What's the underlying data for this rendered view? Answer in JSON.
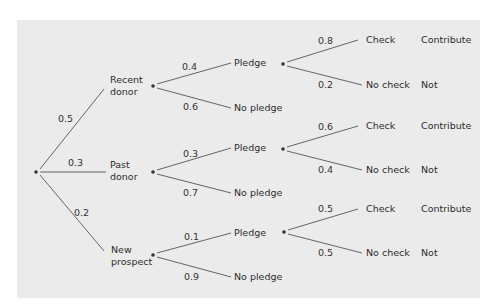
{
  "diagram": {
    "type": "probability-tree",
    "background": "#ebebeb",
    "line_color": "#555555",
    "text_color": "#2b2b2b",
    "root": {
      "x": 36,
      "y": 172
    },
    "level1": [
      {
        "label_lines": [
          "Recent",
          "donor"
        ],
        "prob": "0.5",
        "node": {
          "x": 153,
          "y": 86
        },
        "label_pos": {
          "x": 110,
          "y": 83
        },
        "edge_end": {
          "x": 104,
          "y": 89
        },
        "prob_pos": {
          "x": 58,
          "y": 122
        }
      },
      {
        "label_lines": [
          "Past",
          "donor"
        ],
        "prob": "0.3",
        "node": {
          "x": 153,
          "y": 172
        },
        "label_pos": {
          "x": 110,
          "y": 168
        },
        "edge_end": {
          "x": 106,
          "y": 172
        },
        "prob_pos": {
          "x": 68,
          "y": 166
        }
      },
      {
        "label_lines": [
          "New",
          "prospect"
        ],
        "prob": "0.2",
        "node": {
          "x": 153,
          "y": 255
        },
        "label_pos": {
          "x": 111,
          "y": 253
        },
        "edge_end": {
          "x": 104,
          "y": 251
        },
        "prob_pos": {
          "x": 74,
          "y": 216
        }
      }
    ],
    "level2": [
      {
        "parent": 0,
        "pledge": {
          "label": "Pledge",
          "prob": "0.4",
          "end": {
            "x": 231,
            "y": 63
          },
          "label_pos": {
            "x": 234,
            "y": 66
          },
          "prob_pos": {
            "x": 182,
            "y": 70
          }
        },
        "no_pledge": {
          "label": "No pledge",
          "prob": "0.6",
          "end": {
            "x": 231,
            "y": 108
          },
          "label_pos": {
            "x": 234,
            "y": 111
          },
          "prob_pos": {
            "x": 183,
            "y": 110
          }
        },
        "pledge_node": {
          "x": 283,
          "y": 64
        },
        "check": {
          "label": "Check",
          "prob": "0.8",
          "end": {
            "x": 358,
            "y": 40
          },
          "label_pos": {
            "x": 366,
            "y": 43
          },
          "prob_pos": {
            "x": 318,
            "y": 44
          },
          "outcome": "Contribute",
          "outcome_pos": {
            "x": 421,
            "y": 43
          }
        },
        "no_check": {
          "label": "No check",
          "prob": "0.2",
          "end": {
            "x": 362,
            "y": 85
          },
          "label_pos": {
            "x": 366,
            "y": 88
          },
          "prob_pos": {
            "x": 318,
            "y": 88
          },
          "outcome": "Not",
          "outcome_pos": {
            "x": 421,
            "y": 88
          }
        }
      },
      {
        "parent": 1,
        "pledge": {
          "label": "Pledge",
          "prob": "0.3",
          "end": {
            "x": 231,
            "y": 148
          },
          "label_pos": {
            "x": 234,
            "y": 151
          },
          "prob_pos": {
            "x": 183,
            "y": 157
          }
        },
        "no_pledge": {
          "label": "No pledge",
          "prob": "0.7",
          "end": {
            "x": 231,
            "y": 193
          },
          "label_pos": {
            "x": 234,
            "y": 196
          },
          "prob_pos": {
            "x": 183,
            "y": 196
          }
        },
        "pledge_node": {
          "x": 283,
          "y": 149
        },
        "check": {
          "label": "Check",
          "prob": "0.6",
          "end": {
            "x": 358,
            "y": 126
          },
          "label_pos": {
            "x": 366,
            "y": 129
          },
          "prob_pos": {
            "x": 318,
            "y": 130
          },
          "outcome": "Contribute",
          "outcome_pos": {
            "x": 421,
            "y": 129
          }
        },
        "no_check": {
          "label": "No check",
          "prob": "0.4",
          "end": {
            "x": 362,
            "y": 170
          },
          "label_pos": {
            "x": 366,
            "y": 173
          },
          "prob_pos": {
            "x": 318,
            "y": 173
          },
          "outcome": "Not",
          "outcome_pos": {
            "x": 421,
            "y": 173
          }
        }
      },
      {
        "parent": 2,
        "pledge": {
          "label": "Pledge",
          "prob": "0.1",
          "end": {
            "x": 231,
            "y": 233
          },
          "label_pos": {
            "x": 234,
            "y": 236
          },
          "prob_pos": {
            "x": 184,
            "y": 240
          }
        },
        "no_pledge": {
          "label": "No pledge",
          "prob": "0.9",
          "end": {
            "x": 231,
            "y": 277
          },
          "label_pos": {
            "x": 234,
            "y": 280
          },
          "prob_pos": {
            "x": 184,
            "y": 280
          }
        },
        "pledge_node": {
          "x": 284,
          "y": 232
        },
        "check": {
          "label": "Check",
          "prob": "0.5",
          "end": {
            "x": 358,
            "y": 209
          },
          "label_pos": {
            "x": 366,
            "y": 212
          },
          "prob_pos": {
            "x": 318,
            "y": 212
          },
          "outcome": "Contribute",
          "outcome_pos": {
            "x": 421,
            "y": 212
          }
        },
        "no_check": {
          "label": "No check",
          "prob": "0.5",
          "end": {
            "x": 362,
            "y": 253
          },
          "label_pos": {
            "x": 366,
            "y": 256
          },
          "prob_pos": {
            "x": 318,
            "y": 256
          },
          "outcome": "Not",
          "outcome_pos": {
            "x": 421,
            "y": 256
          }
        }
      }
    ]
  }
}
